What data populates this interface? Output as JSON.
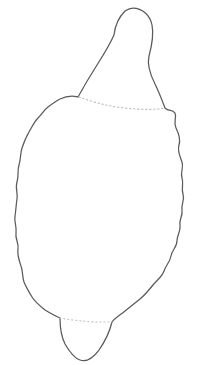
{
  "figure": {
    "title": "Specimen outline drawing",
    "kind": "line-drawing",
    "background_color": "#ffffff",
    "canvas": {
      "width": 199,
      "height": 365
    },
    "stroke": {
      "outline_color": "#5a5a5a",
      "outline_width": 1.25,
      "suture_color": "#bcbcbc",
      "suture_width": 1.1,
      "suture_dash": "1.4 2.6"
    },
    "parts": [
      {
        "name": "apical-knob",
        "label": "Apical knob",
        "description": "Rounded cap at the top of the specimen with a narrow neck"
      },
      {
        "name": "body-outline",
        "label": "Body outline",
        "description": "Large ovate body with finely crenulate (bumpy) left and right margins"
      },
      {
        "name": "basal-lobe",
        "label": "Basal lobe",
        "description": "Small rounded protrusion at the base, offset to the left"
      },
      {
        "name": "upper-suture",
        "label": "Upper suture line",
        "description": "Faint dotted line crossing the body below the apical knob"
      },
      {
        "name": "lower-suture",
        "label": "Lower suture line",
        "description": "Faint dotted line across the base of the basal lobe"
      }
    ],
    "geometry": {
      "outline_d": "M 133 8 C 142 8 150 15 152 25 C 154 35 152 45 149 56 C 147 64 150 74 155 84 C 159 92 162 100 165 108 C 169 112 172 109 175 113 C 177 118 173 122 176 128 C 179 134 181 139 179 145 C 177 151 180 156 182 162 C 184 168 180 172 182 178 C 184 184 181 188 183 194 C 185 200 181 204 182 210 C 183 216 179 219 180 225 C 181 231 177 235 177 241 C 177 247 172 250 171 256 C 170 262 166 265 164 271 C 162 277 157 280 153 285 C 149 290 145 295 140 299 C 135 303 130 307 125 311 C 120 315 115 318 112 322 C 110 330 106 340 99 350 C 93 358 86 362 80 360 C 74 358 69 351 65 344 C 61 336 60 328 60 318 C 55 316 50 313 45 310 C 40 306 35 302 32 297 C 29 292 26 287 24 282 C 22 276 23 271 21 266 C 19 260 17 255 18 249 C 19 243 15 239 16 233 C 17 227 14 222 15 216 C 16 210 16 205 17 199 C 18 193 15 188 17 182 C 19 176 17 171 19 165 C 21 159 20 154 22 148 C 24 142 26 137 29 132 C 32 127 34 122 38 118 C 42 114 44 110 48 107 C 52 104 56 101 60 99 C 64 97 68 96 72 96 C 75 96 77 97 78 97 C 84 86 90 76 97 65 C 104 54 110 44 114 35 C 115 26 119 17 125 11 C 128 9 131 8 133 8 Z",
      "upper_suture_d": "M 79 97 C 90 101 103 105 117 107 C 131 109 146 110 158 109 C 161 109 163 108 165 108",
      "lower_suture_d": "M 60 318 C 70 320 82 321 94 322 C 101 322 107 322 112 322"
    }
  }
}
